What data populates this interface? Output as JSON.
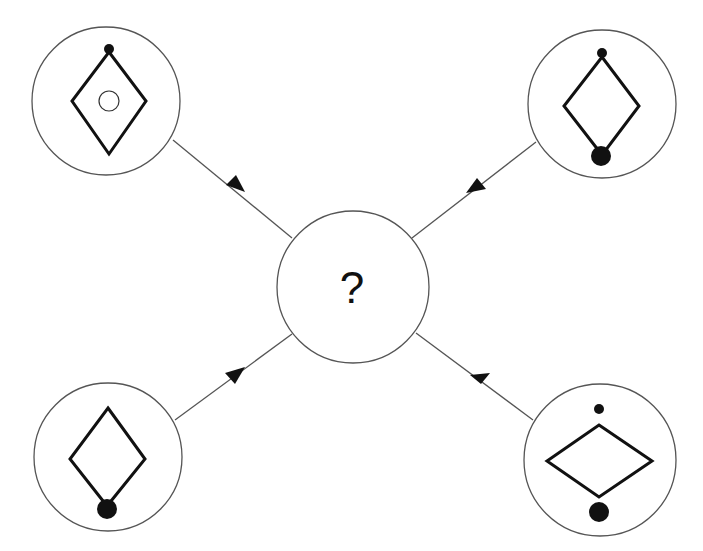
{
  "diagram": {
    "type": "pattern-puzzle",
    "center": {
      "label": "?",
      "cx": 353,
      "cy": 287,
      "r": 76
    },
    "nodes": [
      {
        "id": "top-left",
        "cx": 106,
        "cy": 101,
        "r": 74,
        "description": "vertical diamond, small dot at top vertex, hollow circle inside"
      },
      {
        "id": "top-right",
        "cx": 602,
        "cy": 104,
        "r": 74,
        "description": "vertical diamond, small dot at top vertex, large dot at bottom vertex"
      },
      {
        "id": "bottom-left",
        "cx": 108,
        "cy": 457,
        "r": 74,
        "description": "vertical diamond, large dot at bottom vertex"
      },
      {
        "id": "bottom-right",
        "cx": 600,
        "cy": 460,
        "r": 76,
        "description": "horizontal diamond, small dot above, large dot below"
      }
    ],
    "arrows": [
      {
        "from": "top-left",
        "to": "center"
      },
      {
        "from": "top-right",
        "to": "center"
      },
      {
        "from": "bottom-left",
        "to": "center"
      },
      {
        "from": "bottom-right",
        "to": "center"
      }
    ],
    "colors": {
      "stroke": "#111111",
      "circle_stroke": "#555555",
      "background": "#ffffff"
    }
  }
}
